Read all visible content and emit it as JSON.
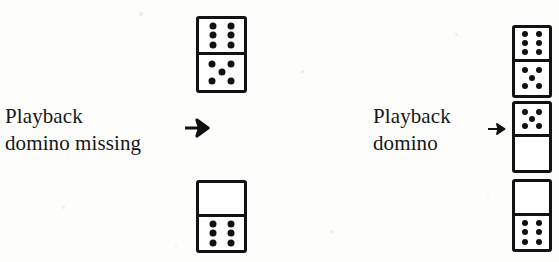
{
  "figure": {
    "background_color": "#fdfdfb",
    "ink_color": "#121212",
    "panels": [
      {
        "id": "left",
        "caption_line1": "Playback",
        "caption_line2": "domino missing",
        "arrow": "right-arrow-bold"
      },
      {
        "id": "right",
        "caption_line1": "Playback",
        "caption_line2": "domino",
        "arrow": "right-arrow-thin"
      }
    ]
  },
  "captions": {
    "left": {
      "line1": "Playback",
      "line2": "domino missing"
    },
    "right": {
      "line1": "Playback",
      "line2": "domino"
    }
  },
  "arrows": {
    "left_label": "→",
    "right_label": "→"
  },
  "dominoes": {
    "left_column": [
      {
        "name": "domino-left-top",
        "top_pips": 6,
        "bottom_pips": 5
      },
      {
        "name": "domino-left-bottom",
        "top_pips": 0,
        "bottom_pips": 6
      }
    ],
    "right_column": [
      {
        "name": "domino-right-1",
        "top_pips": 6,
        "bottom_pips": 5
      },
      {
        "name": "domino-right-2",
        "top_pips": 5,
        "bottom_pips": 0
      },
      {
        "name": "domino-right-3",
        "top_pips": 0,
        "bottom_pips": 6
      }
    ]
  },
  "pip_layouts": {
    "0": [],
    "1": [
      [
        50,
        50
      ]
    ],
    "2": [
      [
        30,
        30
      ],
      [
        70,
        70
      ]
    ],
    "3": [
      [
        28,
        26
      ],
      [
        50,
        50
      ],
      [
        72,
        74
      ]
    ],
    "4": [
      [
        30,
        28
      ],
      [
        70,
        28
      ],
      [
        30,
        72
      ],
      [
        70,
        72
      ]
    ],
    "5": [
      [
        28,
        26
      ],
      [
        72,
        26
      ],
      [
        50,
        50
      ],
      [
        28,
        74
      ],
      [
        72,
        74
      ]
    ],
    "6": [
      [
        30,
        21
      ],
      [
        70,
        21
      ],
      [
        30,
        50
      ],
      [
        70,
        50
      ],
      [
        30,
        79
      ],
      [
        70,
        79
      ]
    ]
  },
  "speckles": [
    {
      "x": 139,
      "y": 12,
      "size": 4
    },
    {
      "x": 301,
      "y": 70,
      "size": 3
    },
    {
      "x": 62,
      "y": 206,
      "size": 3
    },
    {
      "x": 455,
      "y": 33,
      "size": 3
    },
    {
      "x": 330,
      "y": 230,
      "size": 3
    },
    {
      "x": 175,
      "y": 245,
      "size": 2
    },
    {
      "x": 487,
      "y": 196,
      "size": 2
    }
  ]
}
